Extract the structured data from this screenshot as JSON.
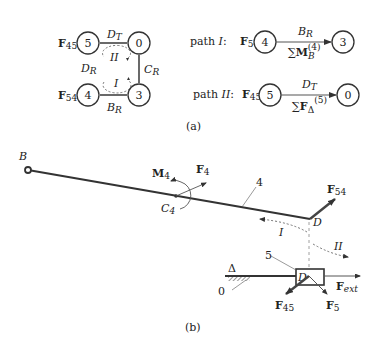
{
  "subfigure_a": {
    "caption": "(a)",
    "graph": {
      "nodes": [
        {
          "id": "5",
          "label": "5",
          "force": "F45"
        },
        {
          "id": "0",
          "label": "0"
        },
        {
          "id": "4",
          "label": "4",
          "force": "F54"
        },
        {
          "id": "3",
          "label": "3"
        }
      ],
      "edges": [
        {
          "from": "5",
          "to": "0",
          "label": "D_T"
        },
        {
          "from": "0",
          "to": "3",
          "label": "C_R"
        },
        {
          "from": "4",
          "to": "3",
          "label": "B_R"
        }
      ],
      "side_label": "D_R",
      "loops": [
        {
          "label": "II"
        },
        {
          "label": "I"
        }
      ]
    },
    "paths": [
      {
        "name": "path I:",
        "force": "F54",
        "from_node": "4",
        "to_node": "3",
        "edge_label": "B_R",
        "equation": "∑M_B^(4)"
      },
      {
        "name": "path II:",
        "force": "F45",
        "from_node": "5",
        "to_node": "0",
        "edge_label": "D_T",
        "equation": "∑F_Δ^(5)"
      }
    ]
  },
  "subfigure_b": {
    "caption": "(b)",
    "labels": {
      "point_B": "B",
      "point_C": "C",
      "point_C_sub": "4",
      "point_D": "D",
      "slider_D": "D",
      "moment": "M",
      "moment_sub": "4",
      "force_F4": "F",
      "force_F4_sub": "4",
      "force_F54": "F",
      "force_F54_sub": "54",
      "force_F45": "F",
      "force_F45_sub": "45",
      "force_F5": "F",
      "force_F5_sub": "5",
      "force_Fext": "F",
      "force_Fext_sub": "ext",
      "link_4": "4",
      "link_5": "5",
      "ground_0": "0",
      "axis": "Δ",
      "path_I": "I",
      "path_II": "II"
    }
  }
}
